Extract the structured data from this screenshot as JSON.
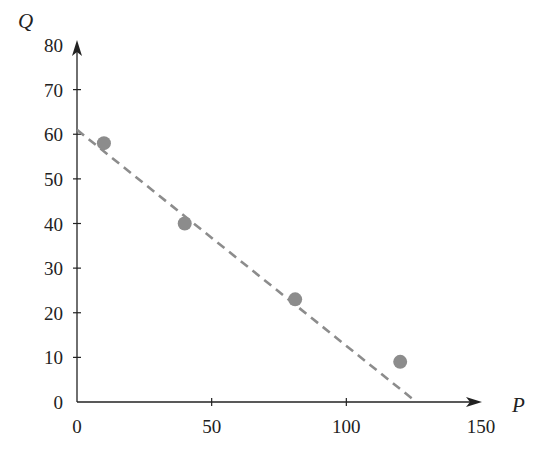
{
  "chart_data": {
    "type": "scatter",
    "title": "",
    "xlabel": "P",
    "ylabel": "Q",
    "xlim": [
      0,
      150
    ],
    "ylim": [
      0,
      80
    ],
    "xticks": [
      0,
      50,
      100,
      150
    ],
    "yticks": [
      0,
      10,
      20,
      30,
      40,
      50,
      60,
      70,
      80
    ],
    "grid": false,
    "legend": null,
    "series": [
      {
        "name": "observations",
        "marker": "circle",
        "color": "#8c8c8c",
        "points": [
          {
            "x": 10,
            "y": 58
          },
          {
            "x": 40,
            "y": 40
          },
          {
            "x": 81,
            "y": 23
          },
          {
            "x": 120,
            "y": 9
          }
        ]
      },
      {
        "name": "fit-line",
        "style": "dashed",
        "color": "#8c8c8c",
        "points": [
          {
            "x": 0,
            "y": 61
          },
          {
            "x": 126,
            "y": 0
          }
        ]
      }
    ]
  },
  "labels": {
    "x_axis_title": "P",
    "y_axis_title": "Q",
    "x_ticks": [
      "0",
      "50",
      "100",
      "150"
    ],
    "y_ticks": [
      "0",
      "10",
      "20",
      "30",
      "40",
      "50",
      "60",
      "70",
      "80"
    ]
  }
}
